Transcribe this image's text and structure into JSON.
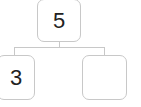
{
  "diagram": {
    "type": "number-bond",
    "whole": {
      "value": "5"
    },
    "parts": [
      {
        "value": "3"
      },
      {
        "value": ""
      }
    ]
  }
}
